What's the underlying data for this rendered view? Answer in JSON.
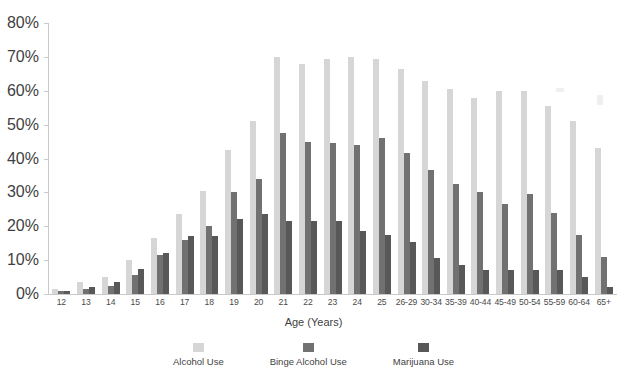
{
  "chart_data": {
    "type": "bar",
    "title": "",
    "xlabel": "Age (Years)",
    "ylabel": "",
    "ylim": [
      0,
      80
    ],
    "ytick_labels": [
      "0%",
      "10%",
      "20%",
      "30%",
      "40%",
      "50%",
      "60%",
      "70%",
      "80%"
    ],
    "ytick_values": [
      0,
      10,
      20,
      30,
      40,
      50,
      60,
      70,
      80
    ],
    "grid": false,
    "legend_position": "bottom",
    "categories": [
      "12",
      "13",
      "14",
      "15",
      "16",
      "17",
      "18",
      "19",
      "20",
      "21",
      "22",
      "23",
      "24",
      "25",
      "26-29",
      "30-34",
      "35-39",
      "40-44",
      "45-49",
      "50-54",
      "55-59",
      "60-64",
      "65+"
    ],
    "series": [
      {
        "name": "Alcohol Use",
        "color": "#d6d6d6",
        "values": [
          1.5,
          3.5,
          5.0,
          10.0,
          16.5,
          23.5,
          30.5,
          42.5,
          51.0,
          70.0,
          68.0,
          69.5,
          70.0,
          69.5,
          66.5,
          63.0,
          60.5,
          58.0,
          60.0,
          60.0,
          55.5,
          51.0,
          43.0
        ]
      },
      {
        "name": "Binge Alcohol Use",
        "color": "#717171",
        "values": [
          0.8,
          1.5,
          2.5,
          5.5,
          11.5,
          16.0,
          20.0,
          30.0,
          34.0,
          47.5,
          45.0,
          44.5,
          44.0,
          46.0,
          41.5,
          36.5,
          32.5,
          30.0,
          26.5,
          29.5,
          24.0,
          17.5,
          11.0
        ]
      },
      {
        "name": "Marijuana Use",
        "color": "#585858",
        "values": [
          0.8,
          2.0,
          3.5,
          7.5,
          12.0,
          17.0,
          17.0,
          22.0,
          23.5,
          21.5,
          21.5,
          21.5,
          18.5,
          17.5,
          15.5,
          10.5,
          8.5,
          7.0,
          7.0,
          7.0,
          7.0,
          5.0,
          2.0
        ]
      }
    ]
  },
  "legend": {
    "items": [
      {
        "label": "Alcohol Use"
      },
      {
        "label": "Binge Alcohol Use"
      },
      {
        "label": "Marijuana Use"
      }
    ]
  },
  "axes": {
    "x_title": "Age (Years)"
  }
}
